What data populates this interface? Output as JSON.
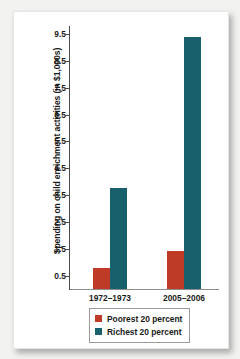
{
  "chart_data": {
    "type": "bar",
    "title": "",
    "xlabel": "",
    "ylabel": "Spending on child enrichment activities (in $1,000s)",
    "categories": [
      "1972–1973",
      "2005–2006"
    ],
    "series": [
      {
        "name": "Poorest 20 percent",
        "color": "#bf3a27",
        "values": [
          0.8,
          1.4
        ]
      },
      {
        "name": "Richest 20 percent",
        "color": "#18606b",
        "values": [
          3.75,
          9.4
        ]
      }
    ],
    "ylim": [
      0,
      9.8
    ],
    "yticks": [
      0.5,
      1.5,
      2.5,
      3.5,
      4.5,
      5.5,
      6.5,
      7.5,
      8.5,
      9.5
    ],
    "ytick_labels": [
      "0.5",
      "1.5",
      "2.5",
      "3.5",
      "4.5",
      "5.5",
      "6.5",
      "7.5",
      "8.5",
      "9.5"
    ],
    "grid": false,
    "legend_position": "bottom-center"
  },
  "legend": {
    "entries": [
      {
        "label": "Poorest 20 percent",
        "color": "#bf3a27"
      },
      {
        "label": "Richest 20 percent",
        "color": "#18606b"
      }
    ]
  },
  "colors": {
    "poorest": "#bf3a27",
    "richest": "#18606b",
    "axis": "#4a4a4a",
    "card": "#ffffff",
    "page_background": "#f2f2f0"
  }
}
